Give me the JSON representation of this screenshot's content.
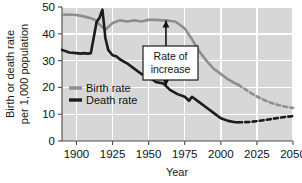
{
  "chart_data": {
    "type": "line",
    "title": "",
    "xlabel": "Year",
    "ylabel_line1": "Birth or death rate",
    "ylabel_line2": "per 1,000 population",
    "xlim": [
      1890,
      2050
    ],
    "ylim": [
      0,
      50
    ],
    "xticks": [
      1900,
      1925,
      1950,
      1975,
      2000,
      2025,
      2050
    ],
    "yticks": [
      0,
      10,
      20,
      30,
      40,
      50
    ],
    "grid": true,
    "legend_position": "inner-left",
    "plot_background": "#d7d7d7",
    "gridline_color": "#ffffff",
    "series": [
      {
        "name": "Birth rate",
        "color": "#8e8e8e",
        "solid_until": 2012,
        "x": [
          1890,
          1895,
          1900,
          1905,
          1910,
          1913,
          1915,
          1918,
          1920,
          1925,
          1930,
          1935,
          1940,
          1945,
          1950,
          1955,
          1960,
          1962,
          1965,
          1968,
          1970,
          1975,
          1980,
          1985,
          1990,
          1995,
          2000,
          2005,
          2010,
          2012
        ],
        "values": [
          47.0,
          47.2,
          47.0,
          46.5,
          45.8,
          45.2,
          44.0,
          42.5,
          41.5,
          44.0,
          45.0,
          44.6,
          45.0,
          44.6,
          45.2,
          45.2,
          45.0,
          45.0,
          44.8,
          44.6,
          44.0,
          42.0,
          38.0,
          33.5,
          30.0,
          27.0,
          25.0,
          23.0,
          21.5,
          21.0
        ],
        "projection_x": [
          2012,
          2015,
          2020,
          2025,
          2030,
          2035,
          2040,
          2045,
          2050
        ],
        "projection_values": [
          21.0,
          20.0,
          18.2,
          16.6,
          15.3,
          14.2,
          13.4,
          12.8,
          12.3
        ]
      },
      {
        "name": "Death rate",
        "color": "#1c1c1c",
        "solid_until": 2012,
        "x": [
          1890,
          1895,
          1900,
          1903,
          1905,
          1908,
          1910,
          1914,
          1916,
          1918,
          1919,
          1920,
          1922,
          1925,
          1928,
          1930,
          1935,
          1940,
          1945,
          1950,
          1955,
          1960,
          1965,
          1970,
          1975,
          1978,
          1980,
          1985,
          1990,
          1995,
          2000,
          2005,
          2010,
          2012
        ],
        "values": [
          34.0,
          33.0,
          32.8,
          32.6,
          32.8,
          32.6,
          32.8,
          44.5,
          46.0,
          49.0,
          44.0,
          38.5,
          34.0,
          32.0,
          31.5,
          30.5,
          29.0,
          27.0,
          25.0,
          24.0,
          22.0,
          21.5,
          19.0,
          17.5,
          16.5,
          15.0,
          16.5,
          14.5,
          12.5,
          10.5,
          8.5,
          7.5,
          7.0,
          7.0
        ],
        "projection_x": [
          2012,
          2015,
          2020,
          2025,
          2030,
          2035,
          2040,
          2045,
          2050
        ],
        "projection_values": [
          7.0,
          7.0,
          7.1,
          7.4,
          7.8,
          8.2,
          8.6,
          9.0,
          9.3
        ]
      }
    ],
    "annotations": [
      {
        "name": "rate-of-increase",
        "label_line1": "Rate of",
        "label_line2": "increase",
        "at_year": 1962,
        "arrow_top_value": 45.0,
        "arrow_bottom_value": 20.5,
        "arrow_style": "double-headed"
      }
    ]
  }
}
